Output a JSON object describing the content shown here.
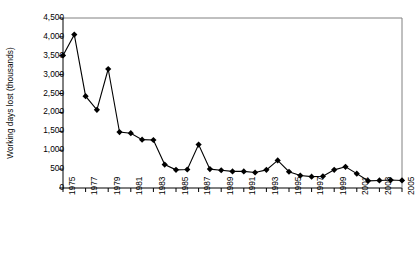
{
  "chart_data": {
    "type": "line",
    "title": "",
    "xlabel": "",
    "ylabel": "Working days lost (thousands)",
    "grid": false,
    "legend": "none",
    "marker": "diamond",
    "ylim": [
      0,
      4500
    ],
    "ytick_step": 500,
    "yticks": [
      "0",
      "500",
      "1,000",
      "1,500",
      "2,000",
      "2,500",
      "3,000",
      "3,500",
      "4,000",
      "4,500"
    ],
    "xlim": [
      1975,
      2005
    ],
    "xtick_step": 2,
    "xticks": [
      "1975",
      "1977",
      "1979",
      "1981",
      "1983",
      "1985",
      "1987",
      "1989",
      "1991",
      "1993",
      "1995",
      "1997",
      "1999",
      "2001",
      "2003",
      "2005"
    ],
    "x": [
      1975,
      1976,
      1977,
      1978,
      1979,
      1980,
      1981,
      1982,
      1983,
      1984,
      1985,
      1986,
      1987,
      1988,
      1989,
      1990,
      1991,
      1992,
      1993,
      1994,
      1995,
      1996,
      1997,
      1998,
      1999,
      2000,
      2001,
      2002,
      2003,
      2004,
      2005
    ],
    "values": [
      3510,
      4060,
      2430,
      2070,
      3150,
      1480,
      1450,
      1280,
      1270,
      620,
      480,
      490,
      1150,
      500,
      470,
      440,
      440,
      410,
      480,
      730,
      430,
      330,
      300,
      310,
      480,
      560,
      380,
      190,
      200,
      210,
      200
    ],
    "series": [
      {
        "name": "Working days lost (thousands)",
        "color": "#000000",
        "values": [
          3510,
          4060,
          2430,
          2070,
          3150,
          1480,
          1450,
          1280,
          1270,
          620,
          480,
          490,
          1150,
          500,
          470,
          440,
          440,
          410,
          480,
          730,
          430,
          330,
          300,
          310,
          480,
          560,
          380,
          190,
          200,
          210,
          200
        ]
      }
    ]
  }
}
